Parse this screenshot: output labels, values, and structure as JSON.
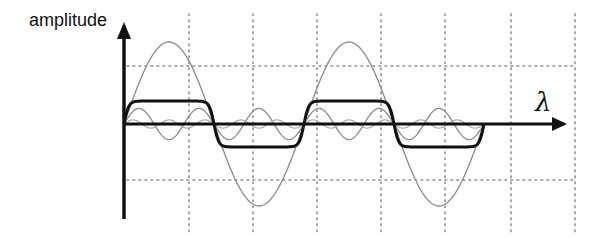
{
  "chart_data": {
    "type": "line",
    "title": "",
    "xlabel": "λ",
    "ylabel": "amplitude",
    "grid": true,
    "legend": null,
    "x_range": [
      0,
      2
    ],
    "x_units": "periods",
    "series": [
      {
        "name": "fundamental",
        "harmonic": 1,
        "relative_amplitude": 1.0,
        "color": "#8a8a8a",
        "stroke_width": 1.3
      },
      {
        "name": "third harmonic",
        "harmonic": 3,
        "relative_amplitude": 0.19,
        "color": "#8a8a8a",
        "stroke_width": 1.3
      },
      {
        "name": "fifth harmonic",
        "harmonic": 5,
        "relative_amplitude": 0.05,
        "color": "#b0b0b0",
        "stroke_width": 1.3
      },
      {
        "name": "sum (square-like)",
        "harmonic": "sum",
        "relative_amplitude": 0.28,
        "color": "#111111",
        "stroke_width": 3
      }
    ]
  },
  "labels": {
    "y_axis": "amplitude",
    "x_axis": "λ"
  },
  "layout": {
    "origin_x": 124,
    "origin_y": 124,
    "period_px": 180,
    "amplitude_px": 82,
    "grid_x": [
      189,
      253,
      317,
      381,
      445,
      511,
      575
    ],
    "grid_y": [
      66,
      180
    ],
    "grid_top": 14,
    "grid_bottom": 232,
    "grid_left": 127,
    "grid_right": 576,
    "axis_top": 22,
    "axis_bottom": 219,
    "axis_right": 567
  },
  "colors": {
    "axis": "#111111",
    "grid": "#8c8c8c",
    "background": "#ffffff"
  }
}
